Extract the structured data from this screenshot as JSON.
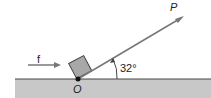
{
  "diagram": {
    "labels": {
      "force_left": "f",
      "force_P": "P",
      "origin": "O",
      "angle": "32°"
    },
    "colors": {
      "ground": "#c8c8c8",
      "block": "#a8a8a8",
      "line": "#777777"
    }
  }
}
